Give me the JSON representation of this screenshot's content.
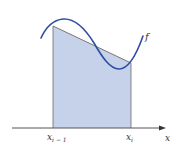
{
  "diagram": {
    "colors": {
      "fill": "#c6d1ea",
      "curve": "#2f4f9e",
      "edges": "#6b6b6b",
      "axis": "#555555",
      "text": "#333333"
    },
    "labels": {
      "function": "f",
      "left_point_base": "x",
      "left_point_sub": "i − 1",
      "right_point_base": "x",
      "right_point_sub": "i",
      "axis": "x"
    }
  }
}
